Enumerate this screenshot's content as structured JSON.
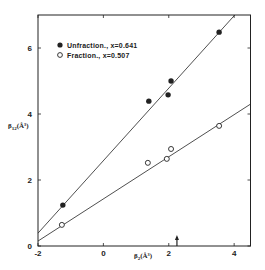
{
  "chart_data": {
    "type": "scatter",
    "title": "",
    "xlabel": "β₂(Å³)",
    "ylabel": "β₁₂(Å³)",
    "xlim": [
      -2,
      4.5
    ],
    "ylim": [
      0,
      7.0
    ],
    "xticks": [
      -2,
      0,
      2,
      4
    ],
    "yticks": [
      0,
      2,
      4,
      6
    ],
    "xtick_labels": [
      "-2",
      "0",
      "2",
      "4"
    ],
    "ytick_labels": [
      "0",
      "2",
      "4",
      "6"
    ],
    "grid": false,
    "legend_position": "upper left",
    "series": [
      {
        "name": "Unfraction., x=0.641",
        "marker": "filled-circle",
        "points": [
          {
            "x": -1.24,
            "y": 1.24
          },
          {
            "x": 1.39,
            "y": 4.39
          },
          {
            "x": 1.98,
            "y": 4.58
          },
          {
            "x": 2.07,
            "y": 5.0
          },
          {
            "x": 3.54,
            "y": 6.48
          }
        ],
        "fit_line": {
          "x": [
            -2,
            4.02
          ],
          "y": [
            0.39,
            7.0
          ]
        }
      },
      {
        "name": "Fraction., x=0.507",
        "marker": "open-circle",
        "points": [
          {
            "x": -1.27,
            "y": 0.64
          },
          {
            "x": 1.36,
            "y": 2.52
          },
          {
            "x": 1.94,
            "y": 2.64
          },
          {
            "x": 2.07,
            "y": 2.94
          },
          {
            "x": 3.54,
            "y": 3.64
          }
        ],
        "fit_line": {
          "x": [
            -2,
            4.5
          ],
          "y": [
            0.15,
            4.3
          ]
        }
      }
    ],
    "annotations": [
      {
        "type": "arrow",
        "x": 2.25,
        "direction": "up",
        "position": "x-axis"
      }
    ]
  },
  "legend": {
    "items": [
      {
        "label": "Unfraction.,  x=0.641",
        "marker": "filled-circle"
      },
      {
        "label": "Fraction.,  x=0.507",
        "marker": "open-circle"
      }
    ]
  },
  "axes": {
    "x_label_main": "β",
    "x_label_sub": "2",
    "x_label_unit": "(Å³)",
    "y_label_main": "β",
    "y_label_sub": "12",
    "y_label_unit": "(Å³)"
  },
  "colors": {
    "ink": "#222222",
    "background": "#ffffff"
  }
}
